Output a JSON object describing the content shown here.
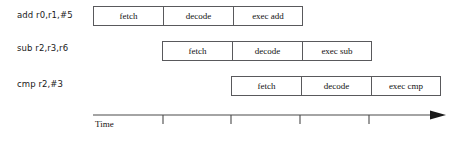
{
  "diagram": {
    "stage_width": 70,
    "row_offset_step": 69,
    "rows": [
      {
        "label": "add r0,r1,#5",
        "label_x": 17,
        "label_y": 10,
        "track_x": 93,
        "track_y": 6,
        "stages": [
          {
            "name": "fetch"
          },
          {
            "name": "decode"
          },
          {
            "name": "exec add"
          }
        ]
      },
      {
        "label": "sub r2,r3,r6",
        "label_x": 17,
        "label_y": 43,
        "track_x": 162,
        "track_y": 41,
        "stages": [
          {
            "name": "fetch"
          },
          {
            "name": "decode"
          },
          {
            "name": "exec sub"
          }
        ]
      },
      {
        "label": "cmp r2,#3",
        "label_x": 17,
        "label_y": 79,
        "track_x": 231,
        "track_y": 76,
        "stages": [
          {
            "name": "fetch"
          },
          {
            "name": "decode"
          },
          {
            "name": "exec cmp"
          }
        ]
      }
    ],
    "axis": {
      "label": "Time",
      "label_x": 95,
      "label_y": 126,
      "line_start_x": 93,
      "line_end_x": 432,
      "line_y": 115,
      "ticks": [
        163,
        231,
        300,
        369
      ],
      "tick_length": 9,
      "arrow_tip_x": 446,
      "color": "#4a4a4a"
    }
  }
}
